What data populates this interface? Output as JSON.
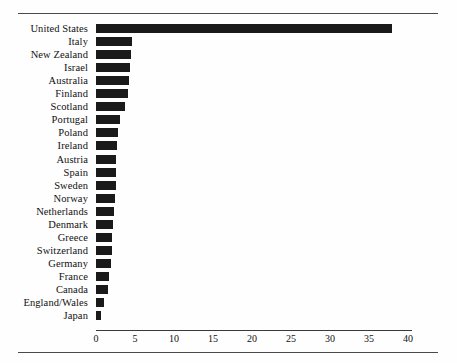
{
  "figure": {
    "title": "",
    "top_rule": true,
    "bottom_rule": true
  },
  "chart_data": {
    "type": "bar",
    "orientation": "horizontal",
    "title": "",
    "subtitle": "",
    "xlabel": "",
    "ylabel": "",
    "xlim": [
      0,
      41
    ],
    "xticks": [
      0,
      5,
      10,
      15,
      20,
      25,
      30,
      35,
      40
    ],
    "xtick_labels": [
      "0",
      "5",
      "10",
      "15",
      "20",
      "25",
      "30",
      "35",
      "40"
    ],
    "grid": false,
    "legend": null,
    "bar_color": "#1a1a1a",
    "axis_color": "#3a3a3a",
    "categories": [
      "United States",
      "Italy",
      "New Zealand",
      "Israel",
      "Australia",
      "Finland",
      "Scotland",
      "Portugal",
      "Poland",
      "Ireland",
      "Austria",
      "Spain",
      "Sweden",
      "Norway",
      "Netherlands",
      "Denmark",
      "Greece",
      "Switzerland",
      "Germany",
      "France",
      "Canada",
      "England/Wales",
      "Japan"
    ],
    "values": [
      38.0,
      4.6,
      4.5,
      4.3,
      4.2,
      4.1,
      3.7,
      3.1,
      2.8,
      2.7,
      2.6,
      2.5,
      2.5,
      2.4,
      2.3,
      2.2,
      2.1,
      2.0,
      1.9,
      1.7,
      1.6,
      1.0,
      0.7
    ]
  }
}
